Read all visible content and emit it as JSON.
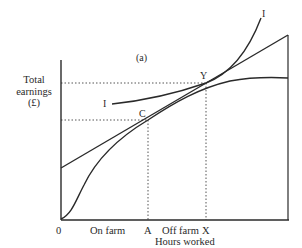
{
  "figure": {
    "panel_label": "(a)",
    "y_axis": {
      "label_line1": "Total",
      "label_line2": "earnings",
      "label_line3": "(£)"
    },
    "x_axis": {
      "origin": "0",
      "segment_on_farm": "On farm",
      "tick_a": "A",
      "segment_off_farm": "Off farm",
      "tick_x": "X",
      "title": "Hours worked"
    },
    "points": {
      "c": "C",
      "y": "Y"
    },
    "curves": {
      "indifference_label_left": "I",
      "indifference_label_right": "I"
    },
    "colors": {
      "ink": "#2a2a2a",
      "background": "#ffffff"
    }
  }
}
